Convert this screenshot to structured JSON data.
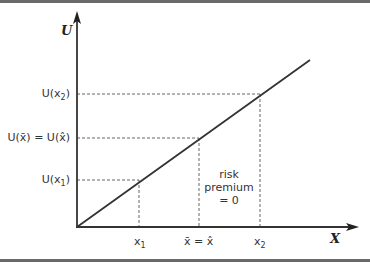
{
  "diagram": {
    "axes": {
      "y_label": "U",
      "x_label": "X"
    },
    "y_ticks": [
      {
        "label": "U(x",
        "sub": "2",
        "suffix": ")"
      },
      {
        "label": "U(x̄) = U(x̂)"
      },
      {
        "label": "U(x",
        "sub": "1",
        "suffix": ")"
      }
    ],
    "x_ticks": [
      {
        "label": "x",
        "sub": "1"
      },
      {
        "label": "x̄ = x̂"
      },
      {
        "label": "x",
        "sub": "2"
      }
    ],
    "annotation": {
      "line1": "risk",
      "line2": "premium",
      "line3": "= 0"
    },
    "colors": {
      "line": "#333333",
      "dash": "#555555",
      "border": "#6a6a6a"
    }
  }
}
